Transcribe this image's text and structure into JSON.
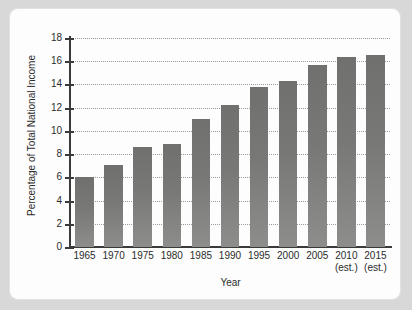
{
  "chart_data": {
    "type": "bar",
    "title": "",
    "xlabel": "Year",
    "ylabel": "Percentage of Total National Income",
    "categories": [
      "1965",
      "1970",
      "1975",
      "1980",
      "1985",
      "1990",
      "1995",
      "2000",
      "2005",
      "2010",
      "2015"
    ],
    "category_notes": [
      "",
      "",
      "",
      "",
      "",
      "",
      "",
      "",
      "",
      "(est.)",
      "(est.)"
    ],
    "values": [
      6.0,
      7.1,
      8.6,
      8.9,
      11.0,
      12.2,
      13.8,
      14.3,
      15.7,
      16.4,
      16.5
    ],
    "ylim": [
      0,
      18
    ],
    "ytick_step": 2,
    "ytick_labels": [
      "18",
      "16",
      "14",
      "12",
      "10",
      "8",
      "6",
      "4",
      "2",
      "0"
    ],
    "grid": true,
    "grid_axis": "y",
    "grid_style": "dotted",
    "legend": false,
    "bar_color": "#78787778",
    "bar_color_top": "#70706f",
    "bar_color_bottom": "#8d8d8c",
    "axis_color": "#3a3a3a",
    "grid_color": "#9a9a9a",
    "panel_background": "#fdfdfd",
    "page_background": "#d8d8d8"
  }
}
